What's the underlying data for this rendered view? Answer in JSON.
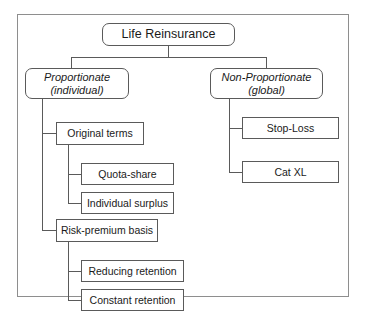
{
  "diagram": {
    "type": "tree",
    "border_color": "#8e8e8e",
    "node_border_color": "#5a5a5a",
    "background": "#ffffff",
    "text_color": "#1a1a1a",
    "nodes": {
      "root": {
        "label": "Life Reinsurance",
        "shape": "rounded",
        "style": "normal",
        "level": 0
      },
      "proportionate": {
        "label": "Proportionate\n(individual)",
        "shape": "rounded",
        "style": "italic",
        "level": 1
      },
      "non_proportionate": {
        "label": "Non-Proportionate\n(global)",
        "shape": "rounded",
        "style": "italic",
        "level": 1
      },
      "original_terms": {
        "label": "Original terms",
        "shape": "rect",
        "style": "normal",
        "level": 2
      },
      "quota_share": {
        "label": "Quota-share",
        "shape": "rect",
        "style": "normal",
        "level": 3
      },
      "individual_surplus": {
        "label": "Individual surplus",
        "shape": "rect",
        "style": "normal",
        "level": 3
      },
      "risk_premium_basis": {
        "label": "Risk-premium basis",
        "shape": "rect",
        "style": "normal",
        "level": 2
      },
      "reducing_retention": {
        "label": "Reducing retention",
        "shape": "rect",
        "style": "normal",
        "level": 3
      },
      "constant_retention": {
        "label": "Constant retention",
        "shape": "rect",
        "style": "normal",
        "level": 3
      },
      "stop_loss": {
        "label": "Stop-Loss",
        "shape": "rect",
        "style": "normal",
        "level": 2
      },
      "cat_xl": {
        "label": "Cat XL",
        "shape": "rect",
        "style": "normal",
        "level": 2
      }
    },
    "edges": [
      {
        "from": "root",
        "to": "proportionate"
      },
      {
        "from": "root",
        "to": "non_proportionate"
      },
      {
        "from": "proportionate",
        "to": "original_terms"
      },
      {
        "from": "proportionate",
        "to": "risk_premium_basis"
      },
      {
        "from": "original_terms",
        "to": "quota_share"
      },
      {
        "from": "original_terms",
        "to": "individual_surplus"
      },
      {
        "from": "risk_premium_basis",
        "to": "reducing_retention"
      },
      {
        "from": "risk_premium_basis",
        "to": "constant_retention"
      },
      {
        "from": "non_proportionate",
        "to": "stop_loss"
      },
      {
        "from": "non_proportionate",
        "to": "cat_xl"
      }
    ]
  }
}
